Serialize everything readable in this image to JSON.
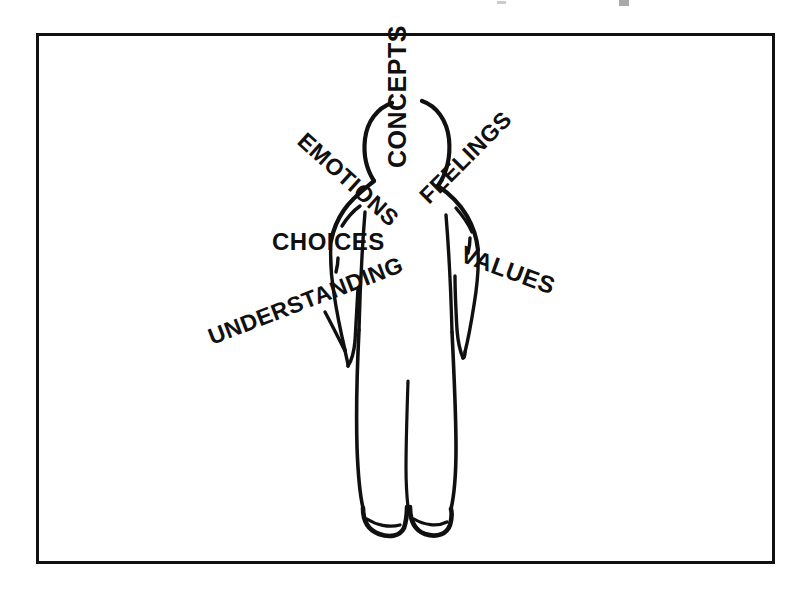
{
  "page": {
    "background_color": "#ffffff",
    "ink_color": "#101010",
    "frame_color": "#111111",
    "width": 801,
    "height": 592
  },
  "frame": {
    "x": 36,
    "y": 33,
    "width": 739,
    "height": 531,
    "stroke_width": 3
  },
  "figure": {
    "name": "human-figure-back-view"
  },
  "labels": [
    {
      "id": "concepts",
      "text": "CONCEPTS",
      "x": 406,
      "y": 168,
      "rotation": -90,
      "font_size": 25,
      "anchor": "start"
    },
    {
      "id": "emotions",
      "text": "EMOTIONS",
      "x": 296,
      "y": 143,
      "rotation": 42,
      "font_size": 23,
      "anchor": "start"
    },
    {
      "id": "feelings",
      "text": "FEELINGS",
      "x": 429,
      "y": 205,
      "rotation": -45,
      "font_size": 23,
      "anchor": "start"
    },
    {
      "id": "choices",
      "text": "CHOICES",
      "x": 272,
      "y": 250,
      "rotation": 0,
      "font_size": 24,
      "anchor": "start"
    },
    {
      "id": "values",
      "text": "VALUES",
      "x": 459,
      "y": 261,
      "rotation": 20,
      "font_size": 24,
      "anchor": "start"
    },
    {
      "id": "understanding",
      "text": "UNDERSTANDING",
      "x": 212,
      "y": 345,
      "rotation": -21,
      "font_size": 23,
      "anchor": "start"
    }
  ],
  "pointers": [
    {
      "id": "pointer-emotions-to-shoulder",
      "description": "short curved stroke from EMOTIONS down to left shoulder"
    },
    {
      "id": "pointer-choices-to-arm",
      "description": "short tick from CHOICES down toward left arm"
    },
    {
      "id": "pointer-understanding-to-hand",
      "description": "diagonal stroke from UNDERSTANDING to left hand"
    },
    {
      "id": "pointer-feelings-to-shoulder",
      "description": "short curved stroke from FEELINGS down to right shoulder"
    },
    {
      "id": "pointer-values-to-hand",
      "description": "stroke from VALUES down to right hand"
    }
  ]
}
